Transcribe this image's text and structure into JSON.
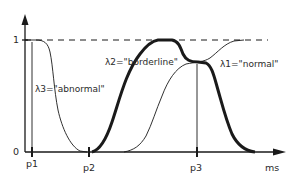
{
  "diagram": {
    "y_axis": {
      "tick_labels": {
        "top": "1",
        "bottom": "0"
      }
    },
    "x_axis": {
      "unit_label": "ms",
      "tick_labels": [
        "p1",
        "p2",
        "p3"
      ]
    },
    "curves": [
      {
        "id": "lambda1",
        "label": "λ1=\"normal\"",
        "style": "thin"
      },
      {
        "id": "lambda2",
        "label": "λ2=\"borderline\"",
        "style": "thick"
      },
      {
        "id": "lambda3",
        "label": "λ3=\"abnormal\"",
        "style": "thin"
      }
    ],
    "reference_line": {
      "value": "1",
      "style": "dashed"
    },
    "colors": {
      "ink": "#1a1a1a",
      "background": "#ffffff"
    }
  }
}
